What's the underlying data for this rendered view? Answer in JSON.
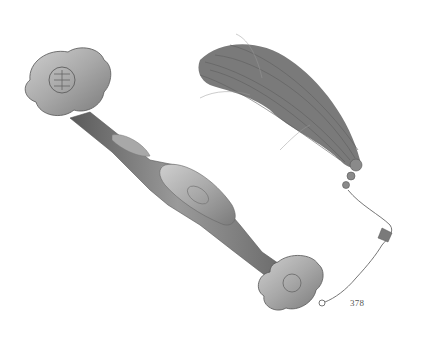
{
  "image": {
    "subject": "ruyi scepter with silk tassel",
    "background_color": "#ffffff",
    "object_color": "#8a8a8a",
    "tassel_color": "#777777"
  },
  "caption": {
    "lot_number": "378"
  }
}
